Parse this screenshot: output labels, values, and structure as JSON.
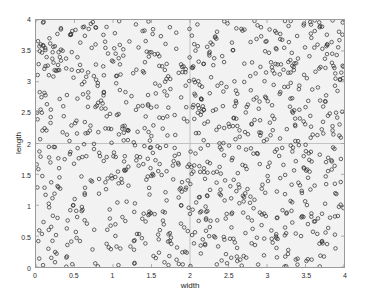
{
  "chart_data": {
    "type": "scatter",
    "title": "",
    "xlabel": "width",
    "ylabel": "length",
    "xlim": [
      0,
      4
    ],
    "ylim": [
      0,
      4
    ],
    "xticks": [
      0,
      0.5,
      1,
      1.5,
      2,
      2.5,
      3,
      3.5,
      4
    ],
    "yticks": [
      0,
      0.5,
      1,
      1.5,
      2,
      2.5,
      3,
      3.5,
      4
    ],
    "xticklabels": [
      "0",
      "0.5",
      "1",
      "1.5",
      "2",
      "2.5",
      "3",
      "3.5",
      "4"
    ],
    "yticklabels": [
      "0",
      "0.5",
      "1",
      "1.5",
      "2",
      "2.5",
      "3",
      "3.5",
      "4"
    ],
    "grid": true,
    "gridlines_x": [
      2
    ],
    "gridlines_y": [
      2
    ],
    "legend": null,
    "marker": {
      "style": "open-circle",
      "radius_px": 1.8,
      "stroke": "#2a2a2a",
      "stroke_width": 0.7,
      "fill": "none"
    },
    "n_points": 1000,
    "distribution": "uniform random over [0,4] x [0,4]",
    "series": [
      {
        "name": "points",
        "x": [
          0.03,
          0.05,
          0.09,
          0.12,
          0.17,
          0.21,
          0.26,
          0.3,
          0.35,
          0.38,
          0.42,
          0.47,
          0.51,
          0.55,
          0.6,
          0.64,
          0.68,
          0.73,
          0.77,
          0.82,
          0.86,
          0.9,
          0.95,
          0.99,
          1.03,
          1.08,
          1.12,
          1.16,
          1.21,
          1.25,
          1.3,
          1.34,
          1.38,
          1.43,
          1.47,
          1.51,
          1.56,
          1.6,
          1.65,
          1.69,
          1.73,
          1.78,
          1.82,
          1.86,
          1.91,
          1.95,
          2.0,
          2.04,
          2.08,
          2.13,
          2.17,
          2.21,
          2.26,
          2.3,
          2.35,
          2.39,
          2.43,
          2.48,
          2.52,
          2.56,
          2.61,
          2.65,
          2.7,
          2.74,
          2.78,
          2.83,
          2.87,
          2.91,
          2.96,
          3.0,
          3.05,
          3.09,
          3.13,
          3.18,
          3.22,
          3.26,
          3.31,
          3.35,
          3.4,
          3.44,
          3.48,
          3.53,
          3.57,
          3.61,
          3.66,
          3.7,
          3.75,
          3.79,
          3.83,
          3.88,
          3.92,
          3.96,
          0.07,
          0.14,
          0.23,
          0.32,
          0.41,
          0.49,
          0.58,
          0.67
        ],
        "y": [
          3.54,
          0.26,
          1.23,
          2.88,
          3.41,
          0.72,
          2.15,
          1.66,
          3.92,
          0.48,
          2.6,
          1.09,
          3.18,
          0.85,
          2.42,
          3.73,
          1.35,
          0.31,
          2.97,
          1.81,
          3.29,
          0.64,
          2.06,
          3.86,
          1.52,
          0.19,
          2.73,
          3.45,
          1.14,
          0.91,
          2.28,
          3.61,
          1.77,
          0.42,
          2.51,
          3.08,
          1.93,
          0.77,
          2.84,
          3.95,
          1.28,
          0.55,
          2.37,
          3.7,
          1.61,
          0.24,
          2.19,
          3.33,
          1.05,
          0.88,
          2.66,
          3.51,
          1.42,
          0.36,
          2.94,
          3.79,
          1.7,
          0.61,
          2.23,
          3.12,
          1.87,
          0.45,
          2.58,
          3.66,
          1.19,
          0.29,
          2.81,
          3.4,
          1.56,
          0.96,
          2.44,
          3.88,
          1.31,
          0.68,
          2.09,
          3.57,
          1.74,
          0.38,
          2.71,
          3.24,
          1.47,
          0.83,
          2.35,
          3.93,
          1.64,
          0.52,
          2.88,
          3.16,
          1.02,
          0.71,
          2.49,
          3.75,
          1.98,
          0.58,
          2.13,
          3.37,
          1.85,
          0.44,
          2.62,
          3.04
        ]
      }
    ]
  },
  "axis": {
    "x_title": "width",
    "y_title": "length",
    "x_tick_labels": [
      "0",
      "0.5",
      "1",
      "1.5",
      "2",
      "2.5",
      "3",
      "3.5",
      "4"
    ],
    "y_tick_labels": [
      "0",
      "0.5",
      "1",
      "1.5",
      "2",
      "2.5",
      "3",
      "3.5",
      "4"
    ]
  },
  "colors": {
    "plot_background": "#f2f2f2",
    "figure_background": "#ffffff",
    "axis_border": "#9a9a9a",
    "gridline": "#b4b4b4",
    "marker_stroke": "#2a2a2a",
    "tick_text": "#2b2b2b",
    "label_text": "#1a1a1a"
  }
}
